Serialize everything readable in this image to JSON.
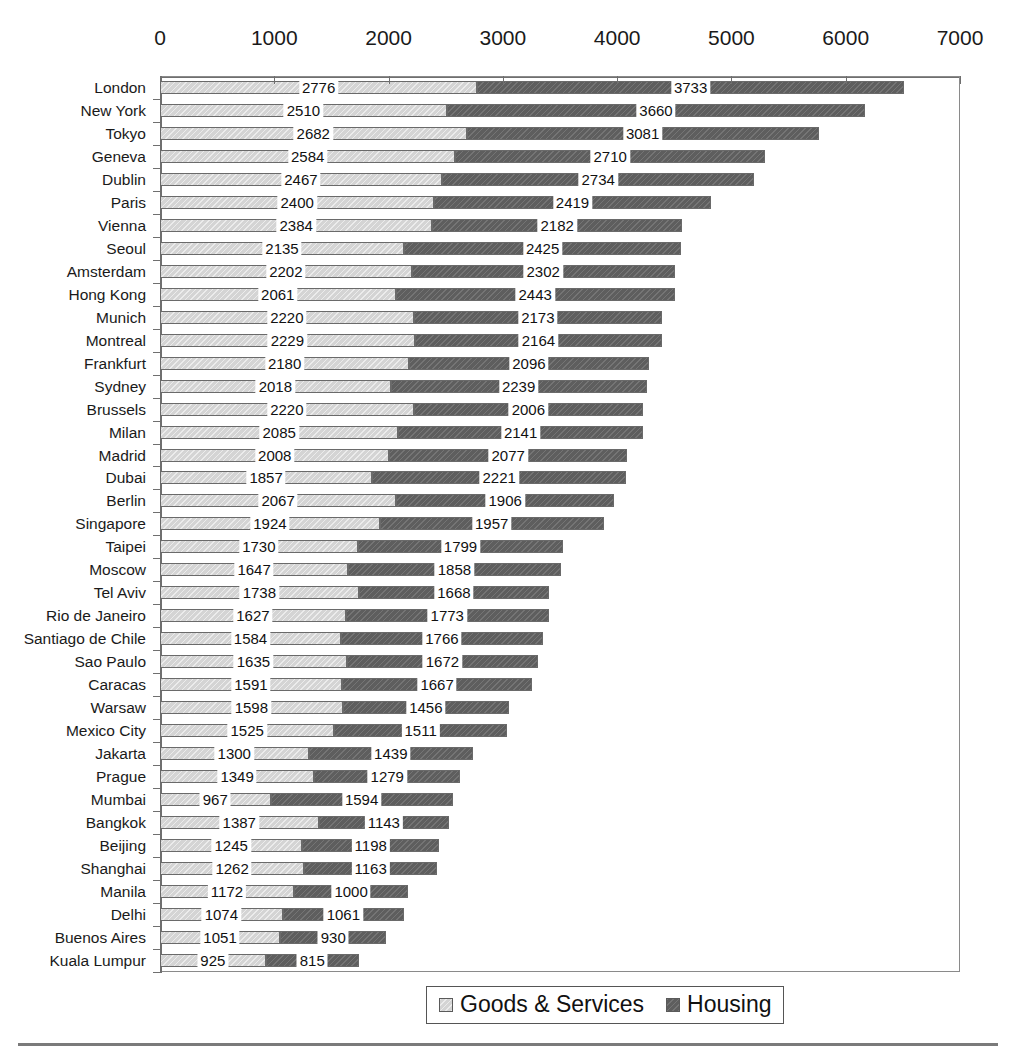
{
  "chart_data": {
    "type": "bar",
    "orientation": "horizontal",
    "stacked": true,
    "title": "",
    "xlabel": "",
    "ylabel": "",
    "xlim": [
      0,
      7000
    ],
    "xticks": [
      0,
      1000,
      2000,
      3000,
      4000,
      5000,
      6000,
      7000
    ],
    "grid": false,
    "legend_position": "bottom",
    "categories": [
      "London",
      "New York",
      "Tokyo",
      "Geneva",
      "Dublin",
      "Paris",
      "Vienna",
      "Seoul",
      "Amsterdam",
      "Hong Kong",
      "Munich",
      "Montreal",
      "Frankfurt",
      "Sydney",
      "Brussels",
      "Milan",
      "Madrid",
      "Dubai",
      "Berlin",
      "Singapore",
      "Taipei",
      "Moscow",
      "Tel Aviv",
      "Rio de Janeiro",
      "Santiago de Chile",
      "Sao Paulo",
      "Caracas",
      "Warsaw",
      "Mexico City",
      "Jakarta",
      "Prague",
      "Mumbai",
      "Bangkok",
      "Beijing",
      "Shanghai",
      "Manila",
      "Delhi",
      "Buenos Aires",
      "Kuala Lumpur"
    ],
    "series": [
      {
        "name": "Goods & Services",
        "color": "#d4d4d4",
        "values": [
          2776,
          2510,
          2682,
          2584,
          2467,
          2400,
          2384,
          2135,
          2202,
          2061,
          2220,
          2229,
          2180,
          2018,
          2220,
          2085,
          2008,
          1857,
          2067,
          1924,
          1730,
          1647,
          1738,
          1627,
          1584,
          1635,
          1591,
          1598,
          1525,
          1300,
          1349,
          967,
          1387,
          1245,
          1262,
          1172,
          1074,
          1051,
          925
        ]
      },
      {
        "name": "Housing",
        "color": "#5e5e5e",
        "values": [
          3733,
          3660,
          3081,
          2710,
          2734,
          2419,
          2182,
          2425,
          2302,
          2443,
          2173,
          2164,
          2096,
          2239,
          2006,
          2141,
          2077,
          2221,
          1906,
          1957,
          1799,
          1858,
          1668,
          1773,
          1766,
          1672,
          1667,
          1456,
          1511,
          1439,
          1279,
          1594,
          1143,
          1198,
          1163,
          1000,
          1061,
          930,
          815
        ]
      }
    ]
  },
  "legend": {
    "items": [
      {
        "label": "Goods & Services",
        "swatch": "goods"
      },
      {
        "label": "Housing",
        "swatch": "housing"
      }
    ]
  }
}
